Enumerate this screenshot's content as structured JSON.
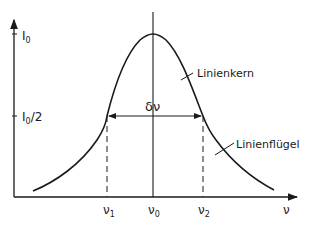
{
  "diagram": {
    "type": "spectral-line-profile",
    "y_axis": {
      "ticks": [
        {
          "label_main": "I",
          "label_sub": "0",
          "label_suffix": ""
        },
        {
          "label_main": "I",
          "label_sub": "0",
          "label_suffix": "/2"
        }
      ]
    },
    "x_axis": {
      "label": "ν",
      "ticks": [
        {
          "label_main": "ν",
          "label_sub": "1"
        },
        {
          "label_main": "ν",
          "label_sub": "0"
        },
        {
          "label_main": "ν",
          "label_sub": "2"
        }
      ]
    },
    "width_label": "δν",
    "annotations": {
      "core": "Linienkern",
      "wing": "Linienflügel"
    },
    "colors": {
      "line": "#1a1a1a",
      "background": "#ffffff"
    }
  }
}
